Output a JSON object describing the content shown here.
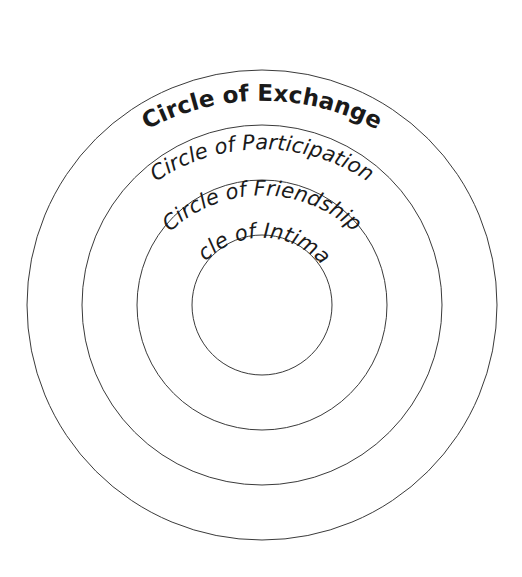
{
  "diagram": {
    "title": "Circle of Exchange",
    "circles": [
      {
        "id": "exchange",
        "label": "Circle of Exchange",
        "order": 4
      },
      {
        "id": "participation",
        "label": "Circle of Participation",
        "order": 3
      },
      {
        "id": "friendship",
        "label": "Circle of Friendship",
        "order": 2
      },
      {
        "id": "intimacy",
        "label": "Circle of Intimacy",
        "order": 1
      }
    ],
    "colors": {
      "stroke": "#3a3a3a",
      "text": "#1a1a1a",
      "background": "#ffffff"
    }
  }
}
